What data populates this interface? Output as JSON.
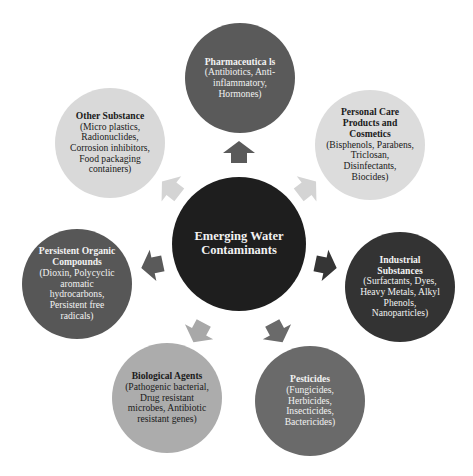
{
  "diagram": {
    "center": {
      "label": "Emerging Water Contaminants",
      "color": "#1e1e1e",
      "cx": 239,
      "cy": 244,
      "r": 67
    },
    "nodes": [
      {
        "id": "pharmaceuticals",
        "title": "Pharmaceutica ls",
        "desc": "(Antibiotics, Anti-inflammatory, Hormones)",
        "color": "#5a5a5a",
        "text": "dark",
        "cx": 240,
        "cy": 78,
        "r": 55
      },
      {
        "id": "personal-care",
        "title": "Personal Care Products and Cosmetics",
        "desc": "(Bisphenols, Parabens, Triclosan, Disinfectants, Biocides)",
        "color": "#dcdcdc",
        "text": "light",
        "cx": 370,
        "cy": 145,
        "r": 55
      },
      {
        "id": "industrial",
        "title": "Industrial Substances",
        "desc": "(Surfactants, Dyes, Heavy Metals, Alkyl Phenols, Nanoparticles)",
        "color": "#333333",
        "text": "dark",
        "cx": 400,
        "cy": 287,
        "r": 55
      },
      {
        "id": "pesticides",
        "title": "Pesticides",
        "desc": "(Fungicides, Herbicides, Insecticides, Bactericides)",
        "color": "#6a6a6a",
        "text": "dark",
        "cx": 310,
        "cy": 401,
        "r": 55
      },
      {
        "id": "biological",
        "title": "Biological Agents",
        "desc": "(Pathogenic bacterial, Drug resistant microbes, Antibiotic resistant genes)",
        "color": "#acacac",
        "text": "light",
        "cx": 167,
        "cy": 398,
        "r": 55
      },
      {
        "id": "persistent-organic",
        "title": "Persistent Organic Compounds",
        "desc": "(Dioxin, Polycyclic aromatic hydrocarbons, Persistent free radicals)",
        "color": "#575757",
        "text": "dark",
        "cx": 77,
        "cy": 284,
        "r": 55
      },
      {
        "id": "other",
        "title": "Other Substance",
        "desc": "(Micro plastics, Radionuclides, Corrosion inhibitors, Food packaging containers)",
        "color": "#d9d9d9",
        "text": "light",
        "cx": 110,
        "cy": 143,
        "r": 55
      }
    ],
    "arrows": [
      {
        "target": "pharmaceuticals",
        "angle": -90,
        "color": "#5a5a5a",
        "x": 239,
        "y": 155
      },
      {
        "target": "personal-care",
        "angle": -38,
        "color": "#d4d4d4",
        "x": 305,
        "y": 190
      },
      {
        "target": "industrial",
        "angle": 12,
        "color": "#353535",
        "x": 323,
        "y": 265
      },
      {
        "target": "pesticides",
        "angle": 62,
        "color": "#6a6a6a",
        "x": 276,
        "y": 330
      },
      {
        "target": "biological",
        "angle": 118,
        "color": "#a8a8a8",
        "x": 200,
        "y": 330
      },
      {
        "target": "persistent-organic",
        "angle": 168,
        "color": "#5a5a5a",
        "x": 155,
        "y": 265
      },
      {
        "target": "other",
        "angle": -142,
        "color": "#d4d4d4",
        "x": 173,
        "y": 190
      }
    ]
  }
}
